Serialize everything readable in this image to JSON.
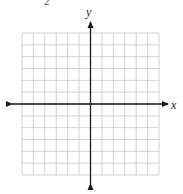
{
  "figure": {
    "top_fragment": "2",
    "x_axis_label": "x",
    "y_axis_label": "y",
    "grid": {
      "columns": 12,
      "rows": 12,
      "origin_col": 6,
      "origin_row": 6
    },
    "colors": {
      "grid": "#c8c8c8",
      "axis": "#1a1a1a",
      "label": "#222222"
    }
  }
}
